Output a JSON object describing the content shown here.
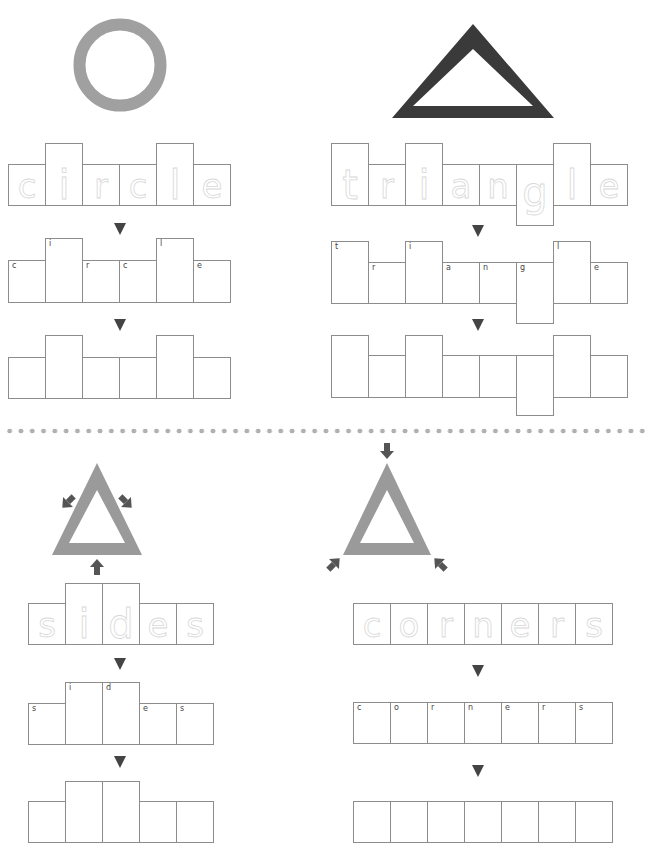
{
  "header": {
    "partial_text": ""
  },
  "colors": {
    "light_shape": "#a0a0a0",
    "dark_shape": "#3a3a3a",
    "arrow": "#444444",
    "cell_border": "#8c8c8c",
    "dots": "#b0b0b0"
  },
  "sections": {
    "circle": {
      "word": "circle",
      "shape": "circle",
      "letters": [
        "c",
        "i",
        "r",
        "c",
        "l",
        "e"
      ],
      "tall": [
        false,
        true,
        false,
        false,
        true,
        false
      ],
      "descender": [
        false,
        false,
        false,
        false,
        false,
        false
      ]
    },
    "triangle": {
      "word": "triangle",
      "shape": "triangle",
      "letters": [
        "t",
        "r",
        "i",
        "a",
        "n",
        "g",
        "l",
        "e"
      ],
      "tall": [
        true,
        false,
        true,
        false,
        false,
        false,
        true,
        false
      ],
      "descender": [
        false,
        false,
        false,
        false,
        false,
        true,
        false,
        false
      ]
    },
    "sides": {
      "word": "sides",
      "shape": "triangle-sides",
      "letters": [
        "s",
        "i",
        "d",
        "e",
        "s"
      ],
      "tall": [
        false,
        true,
        true,
        false,
        false
      ],
      "descender": [
        false,
        false,
        false,
        false,
        false
      ]
    },
    "corners": {
      "word": "corners",
      "shape": "triangle-corners",
      "letters": [
        "c",
        "o",
        "r",
        "n",
        "e",
        "r",
        "s"
      ],
      "tall": [
        false,
        false,
        false,
        false,
        false,
        false,
        false
      ],
      "descender": [
        false,
        false,
        false,
        false,
        false,
        false,
        false
      ]
    }
  }
}
